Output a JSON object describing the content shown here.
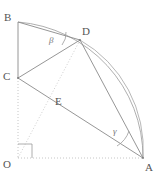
{
  "figure": {
    "type": "geometry-diagram",
    "width": 163,
    "height": 179,
    "background_color": "#ffffff",
    "stroke_color": "#8a8a8a",
    "dotted_color": "#b0b0b0",
    "label_color": "#555555",
    "angle_color": "#777777"
  },
  "points": [
    {
      "name": "O",
      "label": "O",
      "x": 18,
      "y": 158,
      "role": "origin"
    },
    {
      "name": "A",
      "label": "A",
      "x": 143,
      "y": 158,
      "role": "arc-endpoint"
    },
    {
      "name": "B",
      "label": "B",
      "x": 18,
      "y": 22,
      "role": "arc-endpoint"
    },
    {
      "name": "C",
      "label": "C",
      "x": 18,
      "y": 78,
      "role": "point-on-OB"
    },
    {
      "name": "D",
      "label": "D",
      "x": 80,
      "y": 40,
      "role": "point-on-arc"
    },
    {
      "name": "E",
      "label": "E",
      "x": 57,
      "y": 103,
      "role": "intersection"
    }
  ],
  "labels": {
    "O": "O",
    "A": "A",
    "B": "B",
    "C": "C",
    "D": "D",
    "E": "E"
  },
  "angles": [
    {
      "name": "beta",
      "label": "β",
      "vertex": "D",
      "description": "angle at D between DB and DC"
    },
    {
      "name": "gamma",
      "label": "γ",
      "vertex": "A",
      "description": "angle at A between AC and AD"
    },
    {
      "name": "right-angle",
      "label": "",
      "vertex": "O",
      "description": "right angle marker at O between OA and OB"
    }
  ],
  "segments": [
    {
      "name": "segment-BC",
      "from": "B",
      "to": "C",
      "style": "solid"
    },
    {
      "name": "segment-CO",
      "from": "C",
      "to": "O",
      "style": "dotted"
    },
    {
      "name": "segment-OA",
      "from": "O",
      "to": "A",
      "style": "dotted"
    },
    {
      "name": "segment-OD",
      "from": "O",
      "to": "D",
      "style": "dotted"
    },
    {
      "name": "segment-BD",
      "from": "B",
      "to": "D",
      "style": "solid"
    },
    {
      "name": "segment-CD",
      "from": "C",
      "to": "D",
      "style": "solid"
    },
    {
      "name": "segment-CA",
      "from": "C",
      "to": "A",
      "style": "solid"
    },
    {
      "name": "segment-DA",
      "from": "D",
      "to": "A",
      "style": "solid"
    }
  ],
  "arcs": [
    {
      "name": "arc-BA",
      "from": "B",
      "to": "A",
      "center": "O",
      "style": "solid"
    },
    {
      "name": "arc-DA",
      "from": "D",
      "to": "A",
      "center": "B",
      "style": "solid"
    }
  ]
}
